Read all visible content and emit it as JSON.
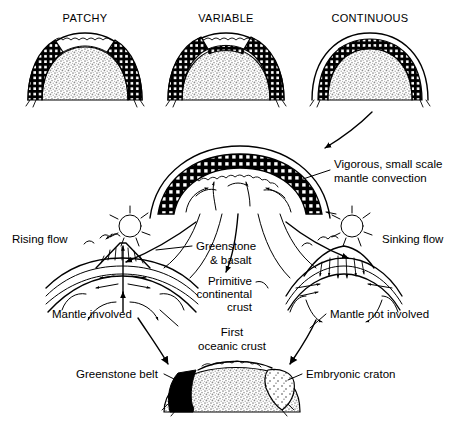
{
  "figure": {
    "title_row": {
      "items": [
        {
          "id": "patchy",
          "label": "PATCHY"
        },
        {
          "id": "variable",
          "label": "VARIABLE"
        },
        {
          "id": "continuous",
          "label": "CONTINUOUS"
        }
      ]
    },
    "labels": {
      "vigorous_convection_line1": "Vigorous, small scale",
      "vigorous_convection_line2": "mantle convection",
      "rising_flow": "Rising flow",
      "sinking_flow": "Sinking flow",
      "greenstone_basalt_line1": "Greenstone",
      "greenstone_basalt_line2": "& basalt",
      "primitive_crust_line1": "Primitive",
      "primitive_crust_line2": "continental",
      "primitive_crust_line3": "crust",
      "mantle_involved": "Mantle involved",
      "mantle_not_involved": "Mantle not involved",
      "first_oceanic_crust_line1": "First",
      "first_oceanic_crust_line2": "oceanic crust",
      "greenstone_belt": "Greenstone belt",
      "embryonic_craton": "Embryonic craton"
    },
    "colors": {
      "ink": "#000000",
      "page": "#ffffff",
      "stipple_fill": "#b4b4b4",
      "crust_black": "#000000"
    },
    "icons": {
      "arrow": "arrow-icon",
      "dome": "dome-icon",
      "convection_cell": "convection-cell-icon",
      "volcano": "volcano-icon",
      "craton": "craton-icon"
    }
  }
}
